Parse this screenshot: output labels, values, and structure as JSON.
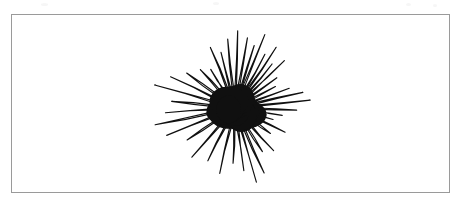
{
  "page": {
    "background_color": "#ffffff",
    "width": 462,
    "height": 203
  },
  "frame": {
    "border_color": "#9a9a9a",
    "border_width": 1,
    "fill_color": "#ffffff",
    "x": 11,
    "y": 14,
    "width": 439,
    "height": 179
  },
  "figure": {
    "name": "starburst-scribble",
    "ink_color": "#101010",
    "core": {
      "center_x": 235,
      "center_y": 108,
      "radius_x": 24,
      "radius_y": 19
    },
    "bounds": {
      "left": 152,
      "right": 311,
      "top": 28,
      "bottom": 185
    },
    "spike_count": 30,
    "spikes": [
      {
        "angle_deg": -88,
        "length": 78,
        "half_width_deg": 2.0
      },
      {
        "angle_deg": -80,
        "length": 72,
        "half_width_deg": 2.4
      },
      {
        "angle_deg": -73,
        "length": 66,
        "half_width_deg": 1.8
      },
      {
        "angle_deg": -68,
        "length": 80,
        "half_width_deg": 2.6
      },
      {
        "angle_deg": -61,
        "length": 62,
        "half_width_deg": 2.0
      },
      {
        "angle_deg": -56,
        "length": 74,
        "half_width_deg": 2.2
      },
      {
        "angle_deg": -50,
        "length": 58,
        "half_width_deg": 1.7
      },
      {
        "angle_deg": -44,
        "length": 69,
        "half_width_deg": 2.3
      },
      {
        "angle_deg": -36,
        "length": 52,
        "half_width_deg": 1.9
      },
      {
        "angle_deg": -28,
        "length": 46,
        "half_width_deg": 2.1
      },
      {
        "angle_deg": -20,
        "length": 58,
        "half_width_deg": 1.8
      },
      {
        "angle_deg": -13,
        "length": 70,
        "half_width_deg": 2.2
      },
      {
        "angle_deg": -6,
        "length": 76,
        "half_width_deg": 1.9
      },
      {
        "angle_deg": 2,
        "length": 62,
        "half_width_deg": 2.0
      },
      {
        "angle_deg": 9,
        "length": 48,
        "half_width_deg": 1.7
      },
      {
        "angle_deg": 17,
        "length": 40,
        "half_width_deg": 2.2
      },
      {
        "angle_deg": 26,
        "length": 56,
        "half_width_deg": 1.8
      },
      {
        "angle_deg": 36,
        "length": 44,
        "half_width_deg": 2.0
      },
      {
        "angle_deg": 48,
        "length": 58,
        "half_width_deg": 2.4
      },
      {
        "angle_deg": 58,
        "length": 52,
        "half_width_deg": 1.8
      },
      {
        "angle_deg": 66,
        "length": 72,
        "half_width_deg": 2.3
      },
      {
        "angle_deg": 74,
        "length": 78,
        "half_width_deg": 2.0
      },
      {
        "angle_deg": 82,
        "length": 64,
        "half_width_deg": 2.5
      },
      {
        "angle_deg": 92,
        "length": 56,
        "half_width_deg": 1.9
      },
      {
        "angle_deg": 103,
        "length": 68,
        "half_width_deg": 2.2
      },
      {
        "angle_deg": 117,
        "length": 60,
        "half_width_deg": 2.0
      },
      {
        "angle_deg": 131,
        "length": 66,
        "half_width_deg": 2.4
      },
      {
        "angle_deg": 146,
        "length": 58,
        "half_width_deg": 1.8
      },
      {
        "angle_deg": 158,
        "length": 74,
        "half_width_deg": 2.3
      },
      {
        "angle_deg": 168,
        "length": 82,
        "half_width_deg": 2.1
      },
      {
        "angle_deg": 176,
        "length": 70,
        "half_width_deg": 1.9
      },
      {
        "angle_deg": 186,
        "length": 64,
        "half_width_deg": 2.2
      },
      {
        "angle_deg": 196,
        "length": 84,
        "half_width_deg": 2.5
      },
      {
        "angle_deg": 206,
        "length": 72,
        "half_width_deg": 1.8
      },
      {
        "angle_deg": 216,
        "length": 60,
        "half_width_deg": 2.0
      },
      {
        "angle_deg": 228,
        "length": 52,
        "half_width_deg": 2.3
      },
      {
        "angle_deg": 238,
        "length": 46,
        "half_width_deg": 1.7
      },
      {
        "angle_deg": 248,
        "length": 66,
        "half_width_deg": 2.1
      },
      {
        "angle_deg": 256,
        "length": 58,
        "half_width_deg": 1.9
      },
      {
        "angle_deg": 264,
        "length": 70,
        "half_width_deg": 2.2
      }
    ]
  },
  "artifacts": {
    "speckles": [
      {
        "x": 41,
        "y": 3,
        "w": 7,
        "h": 3
      },
      {
        "x": 213,
        "y": 2,
        "w": 6,
        "h": 3
      },
      {
        "x": 406,
        "y": 3,
        "w": 5,
        "h": 3
      },
      {
        "x": 433,
        "y": 4,
        "w": 4,
        "h": 3
      }
    ]
  }
}
